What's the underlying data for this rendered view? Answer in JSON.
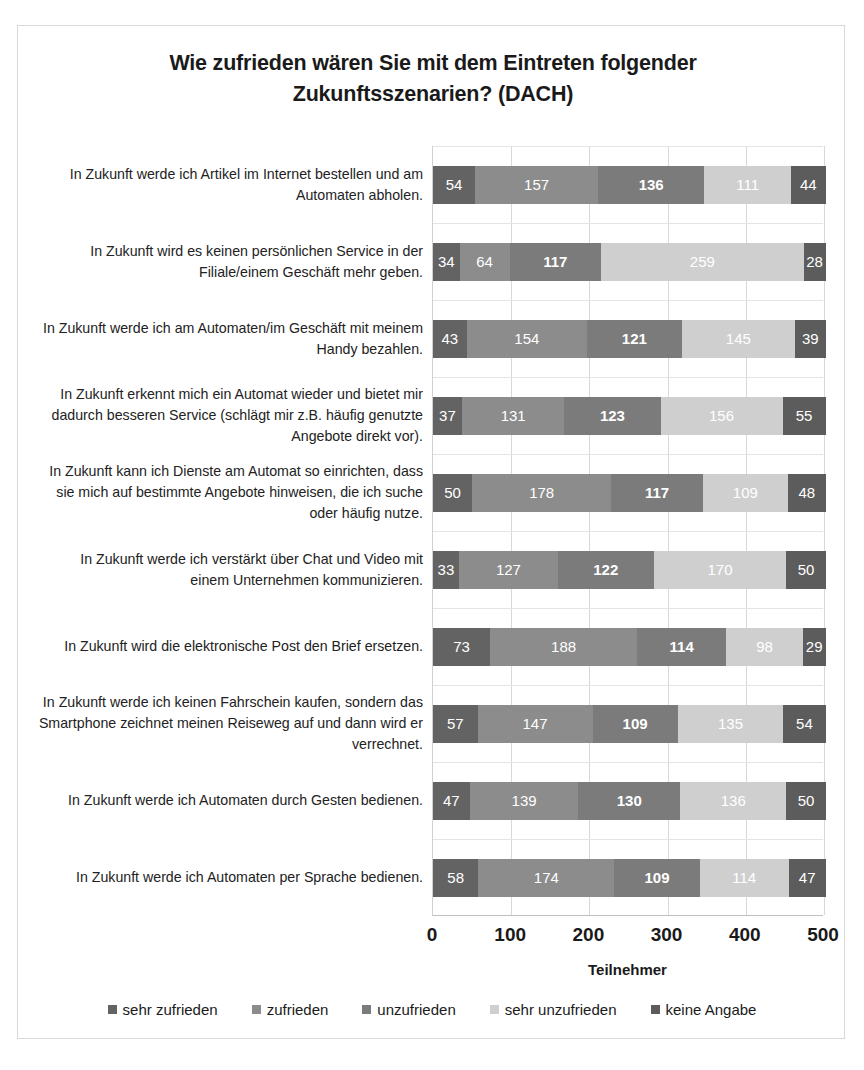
{
  "chart_data": {
    "type": "bar",
    "orientation": "horizontal",
    "stacked": true,
    "title": "Wie zufrieden wären Sie mit dem Eintreten folgender Zukunftsszenarien? (DACH)",
    "title_line1": "Wie zufrieden wären Sie mit dem Eintreten folgender",
    "title_line2": "Zukunftsszenarien? (DACH)",
    "xlabel": "Teilnehmer",
    "ylabel": "",
    "xlim": [
      0,
      500
    ],
    "xticks": [
      0,
      100,
      200,
      300,
      400,
      500
    ],
    "xtick_labels": [
      "0",
      "100",
      "200",
      "300",
      "400",
      "500"
    ],
    "grid": true,
    "legend_position": "bottom",
    "categories": [
      "In Zukunft werde ich Artikel im Internet bestellen und am Automaten abholen.",
      "In Zukunft wird es keinen persönlichen Service in der Filiale/einem Geschäft mehr geben.",
      "In Zukunft werde ich am Automaten/im Geschäft mit meinem Handy bezahlen.",
      "In Zukunft erkennt mich ein Automat wieder und bietet mir dadurch besseren Service (schlägt mir z.B. häufig genutzte Angebote direkt vor).",
      "In Zukunft kann ich Dienste am Automat so einrichten, dass sie mich auf bestimmte Angebote hinweisen, die ich suche oder häufig nutze.",
      "In Zukunft werde ich verstärkt über Chat und Video mit einem Unternehmen kommunizieren.",
      "In Zukunft wird die elektronische Post den Brief ersetzen.",
      "In Zukunft werde ich keinen Fahrschein kaufen, sondern das Smartphone zeichnet meinen Reiseweg auf und dann wird er verrechnet.",
      "In Zukunft werde ich Automaten durch Gesten bedienen.",
      "In Zukunft werde ich Automaten per Sprache bedienen."
    ],
    "series": [
      {
        "name": "sehr zufrieden",
        "color": "#636363",
        "values": [
          54,
          34,
          43,
          37,
          50,
          33,
          73,
          57,
          47,
          58
        ]
      },
      {
        "name": "zufrieden",
        "color": "#8c8c8c",
        "values": [
          157,
          64,
          154,
          131,
          178,
          127,
          188,
          147,
          139,
          174
        ]
      },
      {
        "name": "unzufrieden",
        "color": "#7b7b7b",
        "values": [
          136,
          117,
          121,
          123,
          117,
          122,
          114,
          109,
          130,
          109
        ]
      },
      {
        "name": "sehr unzufrieden",
        "color": "#cfcfcf",
        "values": [
          111,
          259,
          145,
          156,
          109,
          170,
          98,
          135,
          136,
          114
        ]
      },
      {
        "name": "keine Angabe",
        "color": "#5c5c5c",
        "values": [
          44,
          28,
          39,
          55,
          48,
          50,
          29,
          54,
          50,
          47
        ]
      }
    ],
    "bold_value_series_index": 2,
    "row_totals": [
      502,
      502,
      502,
      502,
      502,
      502,
      502,
      502,
      502,
      502
    ]
  }
}
